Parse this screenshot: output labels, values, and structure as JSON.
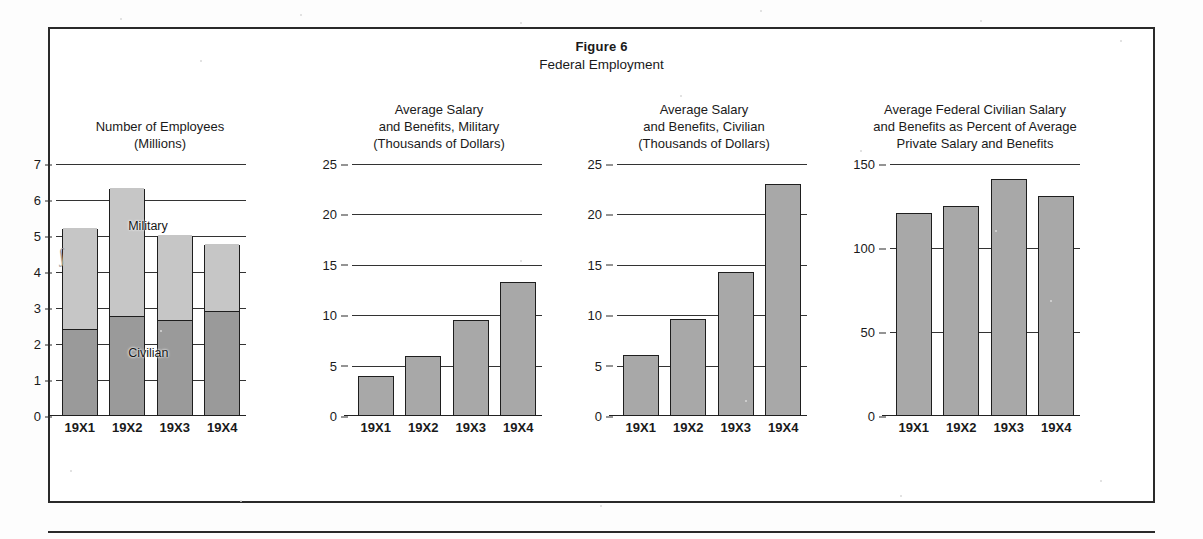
{
  "figure": {
    "number_label": "Figure 6",
    "title": "Federal Employment"
  },
  "chart_data": [
    {
      "type": "bar",
      "stacked": true,
      "title": "Number of Employees",
      "subtitle": "(Millions)",
      "title_lines": [
        "Number of Employees",
        "(Millions)"
      ],
      "categories": [
        "19X1",
        "19X2",
        "19X3",
        "19X4"
      ],
      "series": [
        {
          "name": "Civilian",
          "values": [
            2.4,
            2.75,
            2.65,
            2.9
          ],
          "color": "#9a9a9a"
        },
        {
          "name": "Military",
          "values": [
            2.8,
            3.55,
            2.35,
            1.85
          ],
          "color": "#c6c6c6"
        }
      ],
      "totals": [
        5.2,
        6.3,
        5.0,
        4.75
      ],
      "inline_labels": [
        "Military",
        "Civilian"
      ],
      "xlabel": "",
      "ylabel": "",
      "ylim": [
        0,
        7
      ],
      "yticks": [
        0,
        1,
        2,
        3,
        4,
        5,
        6,
        7
      ],
      "grid": true,
      "legend": "inline"
    },
    {
      "type": "bar",
      "stacked": false,
      "title": "Average Salary and Benefits, Military",
      "title_lines": [
        "Average Salary",
        "and Benefits, Military",
        "(Thousands of Dollars)"
      ],
      "categories": [
        "19X1",
        "19X2",
        "19X3",
        "19X4"
      ],
      "values": [
        4.0,
        6.0,
        9.5,
        13.3
      ],
      "color": "#a8a8a8",
      "xlabel": "",
      "ylabel": "Thousands of Dollars",
      "ylim": [
        0,
        25
      ],
      "yticks": [
        0,
        5,
        10,
        15,
        20,
        25
      ],
      "grid": true
    },
    {
      "type": "bar",
      "stacked": false,
      "title": "Average Salary and Benefits, Civilian",
      "title_lines": [
        "Average Salary",
        "and Benefits, Civilian",
        "(Thousands of Dollars)"
      ],
      "categories": [
        "19X1",
        "19X2",
        "19X3",
        "19X4"
      ],
      "values": [
        6.1,
        9.6,
        14.3,
        23.0
      ],
      "color": "#a8a8a8",
      "xlabel": "",
      "ylabel": "Thousands of Dollars",
      "ylim": [
        0,
        25
      ],
      "yticks": [
        0,
        5,
        10,
        15,
        20,
        25
      ],
      "grid": true
    },
    {
      "type": "bar",
      "stacked": false,
      "title": "Average Federal Civilian Salary and Benefits as Percent of Average Private Salary and Benefits",
      "title_lines": [
        "Average Federal Civilian Salary",
        "and Benefits as Percent of Average",
        "Private Salary and Benefits"
      ],
      "categories": [
        "19X1",
        "19X2",
        "19X3",
        "19X4"
      ],
      "values": [
        121,
        125,
        141,
        131
      ],
      "color": "#a8a8a8",
      "xlabel": "",
      "ylabel": "Percent",
      "ylim": [
        0,
        150
      ],
      "yticks": [
        0,
        50,
        100,
        150
      ],
      "grid": true
    }
  ]
}
